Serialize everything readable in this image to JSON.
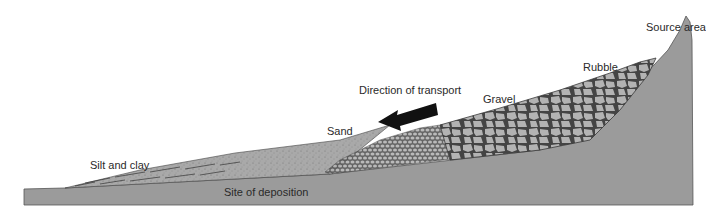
{
  "diagram": {
    "labels": {
      "source_area": "Source area",
      "rubble": "Rubble",
      "gravel": "Gravel",
      "sand": "Sand",
      "silt_clay": "Silt and clay",
      "direction": "Direction of transport",
      "deposition": "Site of deposition"
    },
    "arrow": {
      "direction": "left",
      "icon": "arrow-left-icon"
    },
    "colors": {
      "bedrock": "#9a9a9a",
      "sediment": "#a8a8a8",
      "clast_fill": "#b0b0b0",
      "outline": "#3a3a3a",
      "arrow": "#111111"
    }
  }
}
